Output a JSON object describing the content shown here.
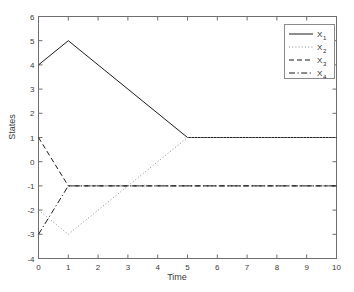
{
  "chart_data": {
    "type": "line",
    "title": "",
    "xlabel": "Time",
    "ylabel": "States",
    "xlim": [
      0,
      10
    ],
    "ylim": [
      -4,
      6
    ],
    "xticks": [
      0,
      1,
      2,
      3,
      4,
      5,
      6,
      7,
      8,
      9,
      10
    ],
    "yticks": [
      -4,
      -3,
      -2,
      -1,
      0,
      1,
      2,
      3,
      4,
      5,
      6
    ],
    "xticklabels": [
      "0",
      "1",
      "2",
      "3",
      "4",
      "5",
      "6",
      "7",
      "8",
      "9",
      "10"
    ],
    "yticklabels": [
      "-4",
      "-3",
      "-2",
      "-1",
      "0",
      "1",
      "2",
      "3",
      "4",
      "5",
      "6"
    ],
    "grid": false,
    "box": true,
    "legend_position": "upper right",
    "series": [
      {
        "name": "X1",
        "label_base": "X",
        "label_sub": "1",
        "linestyle": "solid",
        "color": "#1a1a1a",
        "x": [
          0,
          1,
          5,
          10
        ],
        "values": [
          4,
          5,
          1,
          1
        ]
      },
      {
        "name": "X2",
        "label_base": "X",
        "label_sub": "2",
        "linestyle": "dotted",
        "color": "#8c8c8c",
        "x": [
          0,
          1,
          5,
          10
        ],
        "values": [
          -2,
          -3,
          1,
          1
        ]
      },
      {
        "name": "X3",
        "label_base": "X",
        "label_sub": "3",
        "linestyle": "dashed",
        "color": "#1a1a1a",
        "x": [
          0,
          1,
          10
        ],
        "values": [
          1,
          -1,
          -1
        ]
      },
      {
        "name": "X4",
        "label_base": "X",
        "label_sub": "4",
        "linestyle": "dashdot",
        "color": "#1a1a1a",
        "x": [
          0,
          1,
          10
        ],
        "values": [
          -3,
          -1,
          -1
        ]
      }
    ]
  },
  "figure": {
    "background_color": "#ffffff",
    "axes_color": "#6e6e6e",
    "tick_color": "#6e6e6e"
  },
  "legend": {
    "entries": [
      {
        "base": "X",
        "sub": "1"
      },
      {
        "base": "X",
        "sub": "2"
      },
      {
        "base": "X",
        "sub": "3"
      },
      {
        "base": "X",
        "sub": "4"
      }
    ]
  }
}
